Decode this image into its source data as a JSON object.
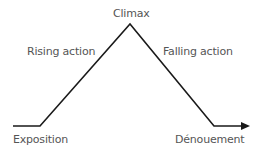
{
  "diagram": {
    "line_color": "#1a1a1a",
    "text_color": "#555555",
    "stages": [
      {
        "id": "exposition",
        "label": "Exposition"
      },
      {
        "id": "rising",
        "label": "Rising action"
      },
      {
        "id": "climax",
        "label": "Climax"
      },
      {
        "id": "falling",
        "label": "Falling action"
      },
      {
        "id": "denouement",
        "label": "Dénouement"
      }
    ],
    "path_points": [
      [
        13,
        126
      ],
      [
        40,
        126
      ],
      [
        130,
        24
      ],
      [
        214,
        126
      ],
      [
        242,
        126
      ]
    ],
    "arrow_end": [
      249,
      126
    ]
  }
}
